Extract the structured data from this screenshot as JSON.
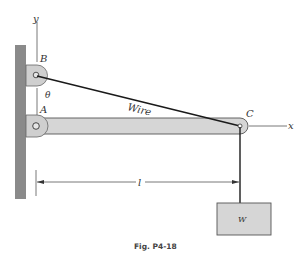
{
  "figure": {
    "caption": "Fig. P4-18",
    "labels": {
      "point_b": "B",
      "point_a": "A",
      "point_c": "C",
      "angle": "θ",
      "wire": "Wire",
      "x_axis": "x",
      "y_axis": "y",
      "length": "l",
      "weight": "W"
    },
    "colors": {
      "wall": "#8a8a8a",
      "bar_fill": "#d6d6d6",
      "bracket_fill": "#cfcfcf",
      "weight_fill": "#d6d6d6",
      "line": "#1a1a1a"
    }
  }
}
